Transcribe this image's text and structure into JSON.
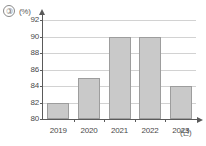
{
  "figure": {
    "item_marker": "③",
    "y_unit_label": "(%)",
    "x_unit_label": "(년)"
  },
  "chart_data": {
    "type": "bar",
    "title": "",
    "subtitle": "",
    "xlabel": "(년)",
    "ylabel": "(%)",
    "categories": [
      "2019",
      "2020",
      "2021",
      "2022",
      "2023"
    ],
    "values": [
      82,
      85,
      90,
      90,
      84
    ],
    "series": [
      {
        "name": "",
        "values": [
          82,
          85,
          90,
          90,
          84
        ]
      }
    ],
    "ylim": [
      80,
      92
    ],
    "yticks": [
      80,
      82,
      84,
      86,
      88,
      90,
      92
    ],
    "ytick_labels": [
      "80",
      "82",
      "84",
      "86",
      "88",
      "90",
      "92"
    ],
    "xtick_labels": [
      "2019",
      "2020",
      "2021",
      "2022",
      "2023"
    ],
    "grid": true,
    "grid_axis": "y",
    "legend": false,
    "legend_position": "none",
    "annotations": [],
    "bar_color": "#c9c9c9",
    "bar_border_color": "#9d9d9d",
    "gridline_color": "#d2d2d2",
    "axis_color": "#5a5a5a"
  }
}
